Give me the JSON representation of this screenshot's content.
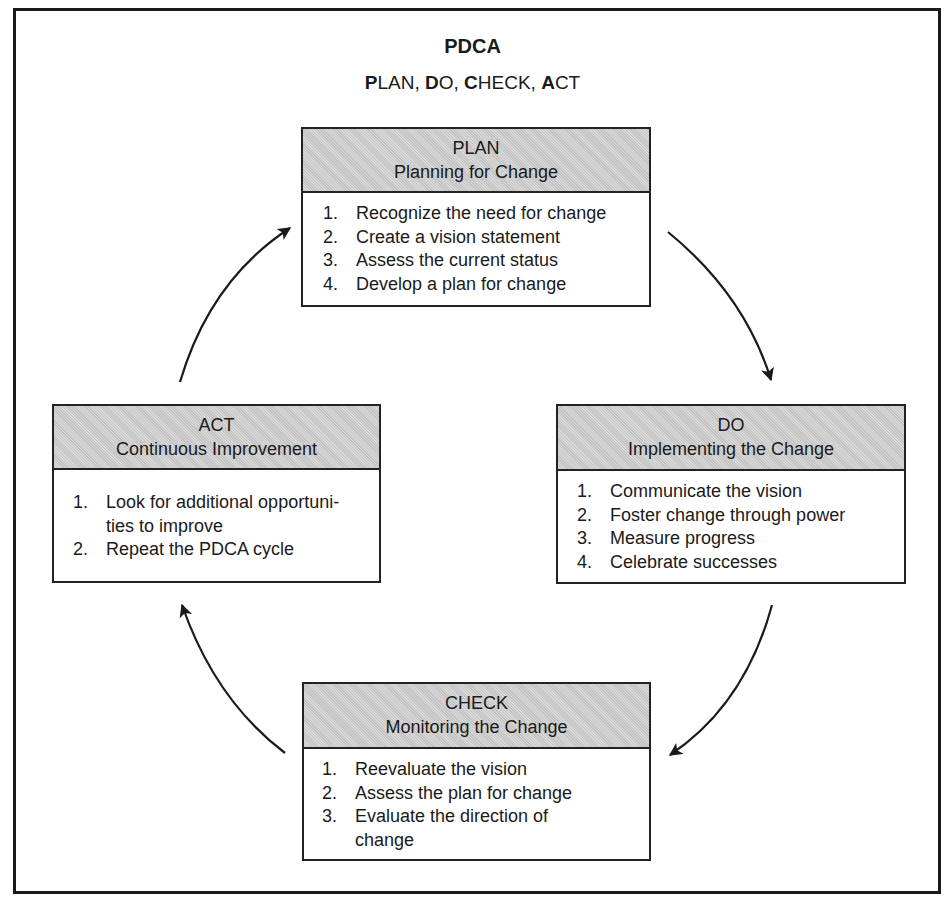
{
  "diagram": {
    "title": "PDCA",
    "subtitle_parts": [
      {
        "bold": "P",
        "rest": "LAN, "
      },
      {
        "bold": "D",
        "rest": "O, "
      },
      {
        "bold": "C",
        "rest": "HECK, "
      },
      {
        "bold": "A",
        "rest": "CT"
      }
    ],
    "boxes": {
      "plan": {
        "heading": "PLAN",
        "subheading": "Planning for Change",
        "items": [
          {
            "num": "1.",
            "text": "Recognize the need for change"
          },
          {
            "num": "2.",
            "text": "Create a vision statement"
          },
          {
            "num": "3.",
            "text": "Assess the current status"
          },
          {
            "num": "4.",
            "text": "Develop a plan for change"
          }
        ]
      },
      "do": {
        "heading": "DO",
        "subheading": "Implementing the Change",
        "items": [
          {
            "num": "1.",
            "text": "Communicate the vision"
          },
          {
            "num": "2.",
            "text": "Foster change through power"
          },
          {
            "num": "3.",
            "text": "Measure progress"
          },
          {
            "num": "4.",
            "text": "Celebrate successes"
          }
        ]
      },
      "check": {
        "heading": "CHECK",
        "subheading": "Monitoring the Change",
        "items": [
          {
            "num": "1.",
            "text": "Reevaluate the vision"
          },
          {
            "num": "2.",
            "text": "Assess the plan for change"
          },
          {
            "num": "3.",
            "text": "Evaluate the direction of change"
          }
        ]
      },
      "act": {
        "heading": "ACT",
        "subheading": "Continuous Improvement",
        "items": [
          {
            "num": "1.",
            "text": "Look for additional opportuni-ties to improve"
          },
          {
            "num": "2.",
            "text": "Repeat the PDCA cycle"
          }
        ]
      }
    },
    "arrows": [
      {
        "from": "plan",
        "to": "do"
      },
      {
        "from": "do",
        "to": "check"
      },
      {
        "from": "check",
        "to": "act"
      },
      {
        "from": "act",
        "to": "plan"
      }
    ],
    "colors": {
      "header_fill": "#cfcfcf",
      "border": "#222222",
      "text": "#1a1a1a"
    }
  }
}
